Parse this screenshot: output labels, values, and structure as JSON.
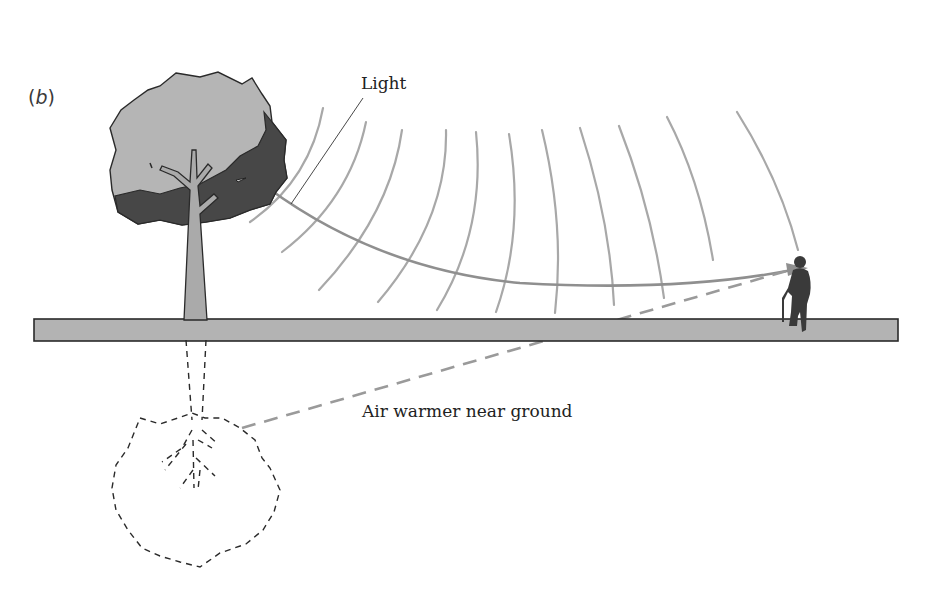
{
  "figure": {
    "panel_label_open": "(",
    "panel_label_letter": "b",
    "panel_label_close": ")",
    "labels": {
      "light": "Light",
      "air": "Air warmer near ground"
    },
    "elements": [
      "tree",
      "tree-shadow-crown",
      "ground",
      "person-with-cane",
      "light-wave-arcs",
      "light-ray-arrow",
      "warm-air-dashed-arrow",
      "underground-roots-dashed-outline"
    ],
    "colors": {
      "crown_light": "#b5b5b5",
      "crown_dark": "#4a4a4a",
      "trunk": "#a9a9a9",
      "ground": "#b3b3b3",
      "outline": "#2a2a2a",
      "arcs": "#a6a6a6",
      "ray": "#8f8f8f",
      "person": "#3a3a3a"
    }
  }
}
